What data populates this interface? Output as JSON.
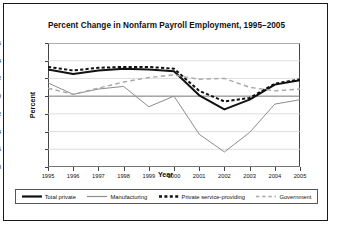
{
  "figure": {
    "title": "Percent Change in Nonfarm Payroll Employment, 1995–2005",
    "xlabel": "Year",
    "ylabel": "Percent"
  },
  "legend": {
    "items": [
      {
        "label": "Total private",
        "style": "solid-thick-black",
        "color": "#111111"
      },
      {
        "label": "Manufacturing",
        "style": "solid-thin-gray",
        "color": "#8c8c8c"
      },
      {
        "label": "Private service-providing",
        "style": "dashed-bold-black",
        "color": "#111111"
      },
      {
        "label": "Government",
        "style": "dashed-light-gray",
        "color": "#a8a8a8"
      }
    ]
  },
  "chart_data": {
    "type": "line",
    "title": "Percent Change in Nonfarm Payroll Employment, 1995–2005",
    "xlabel": "Year",
    "ylabel": "Percent",
    "x": [
      1995,
      1996,
      1997,
      1998,
      1999,
      2000,
      2001,
      2002,
      2003,
      2004,
      2005
    ],
    "xticklabels": [
      "1995",
      "1996",
      "1997",
      "1998",
      "1999",
      "2000",
      "2001",
      "2002",
      "2003",
      "2004",
      "2005"
    ],
    "yticks": [
      6,
      4,
      2,
      0,
      -2,
      -4,
      -6,
      -8
    ],
    "ylim": [
      -8,
      6
    ],
    "xlim": [
      1995,
      2005
    ],
    "grid": true,
    "legend_position": "below-axes",
    "series": [
      {
        "name": "Total private",
        "color": "#111111",
        "linestyle": "solid",
        "linewidth": 2.0,
        "values": [
          3.0,
          2.5,
          2.9,
          3.1,
          3.0,
          2.8,
          0.1,
          -1.5,
          -0.4,
          1.3,
          1.8
        ]
      },
      {
        "name": "Manufacturing",
        "color": "#8c8c8c",
        "linestyle": "solid",
        "linewidth": 1.0,
        "values": [
          1.5,
          0.2,
          0.8,
          1.1,
          -1.2,
          0.0,
          -4.3,
          -6.3,
          -4.1,
          -0.9,
          -0.4
        ]
      },
      {
        "name": "Private service-providing",
        "color": "#111111",
        "linestyle": "dashed-bold",
        "linewidth": 2.0,
        "values": [
          3.3,
          2.9,
          3.2,
          3.3,
          3.3,
          3.1,
          0.6,
          -0.6,
          -0.2,
          1.4,
          1.9
        ]
      },
      {
        "name": "Government",
        "color": "#a8a8a8",
        "linestyle": "dashed-light",
        "linewidth": 1.4,
        "values": [
          0.9,
          0.2,
          0.9,
          1.6,
          2.1,
          2.4,
          1.9,
          2.0,
          1.0,
          0.6,
          0.8
        ]
      }
    ]
  }
}
